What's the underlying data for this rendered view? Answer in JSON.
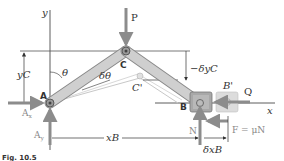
{
  "figure": {
    "caption": "Fig. 10.5",
    "labels": {
      "y_axis": "y",
      "x_axis": "x",
      "point_A": "A",
      "point_B": "B",
      "point_B_prime": "B'",
      "point_C": "C",
      "point_C_prime": "C'",
      "force_P": "P",
      "force_Q": "Q",
      "reaction_Ax": "Ax",
      "reaction_Ay": "Ay",
      "normal_N": "N",
      "friction": "F = μN",
      "angle_theta": "θ",
      "angle_delta_theta": "δθ",
      "height_yC": "yC",
      "delta_yC": "−δyC",
      "distance_xB": "xB",
      "delta_xB": "δxB"
    },
    "colors": {
      "member": "#c8c8c8",
      "member_edge": "#8a8a8a",
      "force_arrow": "#8c8c8c",
      "line": "#333333",
      "slider": "#9a9a9a",
      "slider_ghost": "#d0d0d0"
    }
  }
}
